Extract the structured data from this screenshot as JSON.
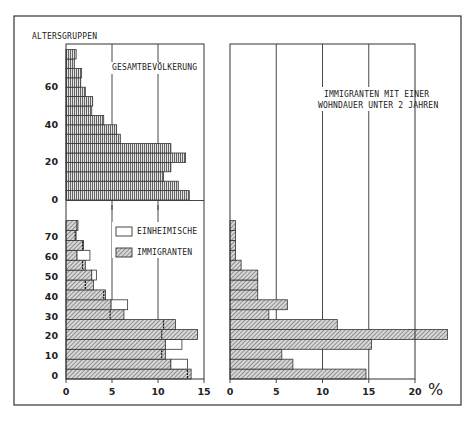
{
  "chart_data": [
    {
      "id": "gesamt",
      "type": "bar",
      "orientation": "horizontal",
      "title": "GESAMTBEVÖLKERUNG",
      "ylabel": "ALTERSGRUPPEN",
      "categories": [
        "0-4",
        "5-9",
        "10-14",
        "15-19",
        "20-24",
        "25-29",
        "30-34",
        "35-39",
        "40-44",
        "45-49",
        "50-54",
        "55-59",
        "60-64",
        "65-69",
        "70-74",
        "75-79"
      ],
      "y_ticks": [
        0,
        20,
        40,
        60
      ],
      "x_ticks": [
        0,
        5,
        10,
        15
      ],
      "xlim": [
        0,
        15
      ],
      "grid": true,
      "series": [
        {
          "name": "Gesamtbevölkerung",
          "pattern": "vertical-lines",
          "values": [
            13.4,
            12.2,
            10.6,
            11.4,
            13.0,
            11.4,
            5.9,
            5.5,
            4.1,
            2.8,
            2.9,
            2.1,
            1.6,
            1.7,
            0.9,
            1.1
          ]
        }
      ]
    },
    {
      "id": "einh_imm",
      "type": "bar",
      "orientation": "horizontal",
      "title": "",
      "categories": [
        "0-4",
        "5-9",
        "10-14",
        "15-19",
        "20-24",
        "25-29",
        "30-34",
        "35-39",
        "40-44",
        "45-49",
        "50-54",
        "55-59",
        "60-64",
        "65-69",
        "70-74",
        "75-79"
      ],
      "y_ticks": [
        0,
        10,
        20,
        30,
        40,
        50,
        60,
        70
      ],
      "x_ticks": [
        0,
        5,
        10,
        15
      ],
      "xlim": [
        0,
        15
      ],
      "xlabel": "",
      "grid": true,
      "legend": {
        "position": "upper right",
        "entries": [
          "EINHEIMISCHE",
          "IMMIGRANTEN"
        ]
      },
      "series": [
        {
          "name": "EINHEIMISCHE",
          "pattern": "outline",
          "values": [
            13.2,
            13.2,
            10.4,
            12.6,
            10.4,
            10.6,
            4.8,
            6.7,
            4.1,
            2.1,
            3.3,
            1.8,
            2.6,
            1.8,
            1.0,
            1.3
          ]
        },
        {
          "name": "IMMIGRANTEN",
          "pattern": "diagonal-hatch",
          "values": [
            13.6,
            11.4,
            10.8,
            10.8,
            14.3,
            11.9,
            6.3,
            4.9,
            4.3,
            3.0,
            2.8,
            2.1,
            1.2,
            1.9,
            1.1,
            1.2
          ]
        }
      ]
    },
    {
      "id": "neu_imm",
      "type": "bar",
      "orientation": "horizontal",
      "title": "IMMIGRANTEN MIT EINER WOHNDAUER UNTER 2 JAHREN",
      "categories": [
        "0-4",
        "5-9",
        "10-14",
        "15-19",
        "20-24",
        "25-29",
        "30-34",
        "35-39",
        "40-44",
        "45-49",
        "50-54",
        "55-59",
        "60-64",
        "65-69",
        "70-74",
        "75-79"
      ],
      "x_ticks": [
        0,
        5,
        10,
        15,
        20
      ],
      "xlim": [
        0,
        20
      ],
      "xlabel": "%",
      "grid": true,
      "series": [
        {
          "name": "Immigranten mit Wohndauer unter 2 Jahren",
          "pattern": "diagonal-hatch",
          "values": [
            14.7,
            6.8,
            5.6,
            15.3,
            23.5,
            11.6,
            4.2,
            6.2,
            3.0,
            3.0,
            3.0,
            1.2,
            0.6,
            0.6,
            0.6,
            0.6
          ]
        }
      ]
    }
  ],
  "labels": {
    "y_axis_title": "ALTERSGRUPPEN",
    "top_left_title": "GESAMTBEVÖLKERUNG",
    "right_title_line1": "IMMIGRANTEN MIT EINER",
    "right_title_line2": "WOHNDAUER UNTER 2 JAHREN",
    "legend_einheimische": "EINHEIMISCHE",
    "legend_immigranten": "IMMIGRANTEN",
    "percent_sign": "%"
  },
  "colors": {
    "ink": "#222222",
    "bar_fill": "#bdbdbd",
    "background": "#ffffff"
  }
}
